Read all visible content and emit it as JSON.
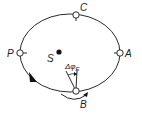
{
  "diagram": {
    "points": {
      "P": {
        "label": "P"
      },
      "C": {
        "label": "C"
      },
      "A": {
        "label": "A"
      },
      "B": {
        "label": "B"
      },
      "S": {
        "label": "S"
      }
    },
    "angle_label": {
      "main": "Δφ",
      "subscript": "E"
    },
    "colors": {
      "stroke": "#2a2a2a",
      "fill": "#ffffff",
      "text": "#222222"
    }
  }
}
